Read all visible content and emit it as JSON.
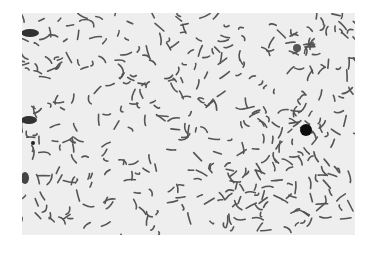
{
  "image": {
    "subject": "micrograph of curved rod-shaped bacteria",
    "style": "grayscale light microscopy",
    "background_color": "#eeeeee",
    "stain_color": "#333333",
    "features": [
      "scattered curved rods",
      "large dark round spot right of center",
      "dark clumps at left edge"
    ]
  }
}
